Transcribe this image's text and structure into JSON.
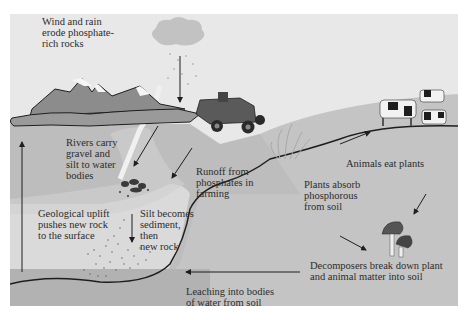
{
  "diagram": {
    "colors": {
      "sky": "#e6e6e6",
      "ground": "#bdbdbd",
      "ground_dark": "#b0b0b0",
      "water": "#d9d9d9",
      "mountain": "#8a8a8a",
      "snow": "#f5f5f5",
      "line": "#1e1e1e",
      "text": "#2c2c2c"
    },
    "labels": {
      "wind_rain": "Wind and rain\nerode phosphate-\nrich rocks",
      "rivers": "Rivers carry\ngravel and\nsilt to water\nbodies",
      "runoff": "Runoff from\nphosphates in\nfarming",
      "uplift": "Geological uplift\npushes new rock\nto the surface",
      "silt": "Silt becomes\nsediment,\nthen\nnew rock",
      "plants_absorb": "Plants absorb\nphosphorous\nfrom soil",
      "animals_eat": "Animals eat plants",
      "decomposers": "Decomposers break down plant\nand animal matter into soil",
      "leaching": "Leaching into bodies\nof water from soil"
    },
    "illustrations": [
      "cloud-rain-icon",
      "mountains-icon",
      "tractor-icon",
      "grass-plant-icon",
      "cows-icon",
      "mushrooms-icon",
      "rock-pile-icon",
      "sediment-dots-icon"
    ]
  }
}
